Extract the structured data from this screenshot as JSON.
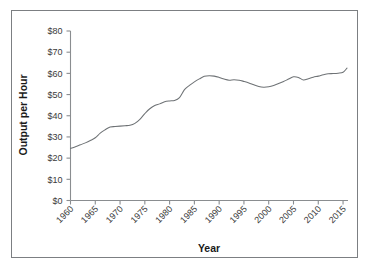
{
  "chart_data": {
    "type": "line",
    "title": "",
    "xlabel": "Year",
    "ylabel": "Output per Hour",
    "xlim": [
      1960,
      2016
    ],
    "ylim": [
      0,
      80
    ],
    "grid": false,
    "legend": "none",
    "line_color": "#6e7275",
    "axis_color": "#8a8d90",
    "frame_color": "#7c7f82",
    "xticks": [
      1960,
      1965,
      1970,
      1975,
      1980,
      1985,
      1990,
      1995,
      2000,
      2005,
      2010,
      2015
    ],
    "xtick_labels": [
      "1960",
      "1965",
      "1970",
      "1975",
      "1980",
      "1985",
      "1990",
      "1995",
      "2000",
      "2005",
      "2010",
      "2015"
    ],
    "xtick_rotation": 45,
    "yticks": [
      0,
      10,
      20,
      30,
      40,
      50,
      60,
      70,
      80
    ],
    "ytick_labels": [
      "$0",
      "$10",
      "$20",
      "$30",
      "$40",
      "$50",
      "$60",
      "$70",
      "$80"
    ],
    "series": [
      {
        "name": "Output per Hour",
        "x": [
          1960,
          1961,
          1962,
          1963,
          1964,
          1965,
          1966,
          1967,
          1968,
          1969,
          1970,
          1971,
          1972,
          1973,
          1974,
          1975,
          1976,
          1977,
          1978,
          1979,
          1980,
          1981,
          1982,
          1983,
          1984,
          1985,
          1986,
          1987,
          1988,
          1989,
          1990,
          1991,
          1992,
          1993,
          1994,
          1995,
          1996,
          1997,
          1998,
          1999,
          2000,
          2001,
          2002,
          2003,
          2004,
          2005,
          2006,
          2007,
          2008,
          2009,
          2010,
          2011,
          2012,
          2013,
          2014,
          2015
        ],
        "y": [
          24.6,
          25.4,
          26.3,
          27.2,
          28.3,
          29.6,
          31.8,
          33.4,
          34.7,
          34.9,
          35.1,
          35.3,
          35.5,
          36.4,
          38.3,
          41.0,
          43.3,
          44.8,
          45.6,
          46.6,
          47.0,
          47.2,
          48.6,
          52.3,
          54.3,
          56.0,
          57.4,
          58.6,
          58.9,
          58.7,
          58.1,
          57.3,
          56.8,
          57.0,
          56.8,
          56.2,
          55.5,
          54.6,
          53.8,
          53.5,
          53.7,
          54.3,
          55.2,
          56.2,
          57.3,
          58.4,
          58.1,
          56.9,
          57.5,
          58.2,
          58.7,
          59.3,
          59.8,
          59.9,
          60.1,
          60.5
        ],
        "last_value": 62.5
      }
    ]
  },
  "figure": {
    "background": "#ffffff"
  }
}
